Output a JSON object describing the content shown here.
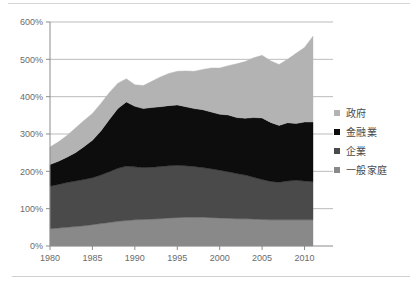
{
  "chart_data": {
    "type": "area",
    "stacked": true,
    "title": "",
    "subtitle": "",
    "xlabel": "",
    "ylabel": "",
    "xlim": [
      1980,
      2011
    ],
    "ylim": [
      0,
      600
    ],
    "ytick_labels": [
      "0%",
      "100%",
      "200%",
      "300%",
      "400%",
      "500%",
      "600%"
    ],
    "ytick_values": [
      0,
      100,
      200,
      300,
      400,
      500,
      600
    ],
    "xtick_labels": [
      "1980",
      "1985",
      "1990",
      "1995",
      "2000",
      "2005",
      "2010"
    ],
    "xtick_values": [
      1980,
      1985,
      1990,
      1995,
      2000,
      2005,
      2010
    ],
    "grid": "horizontal",
    "legend_position": "right",
    "x": [
      1980,
      1981,
      1982,
      1983,
      1984,
      1985,
      1986,
      1987,
      1988,
      1989,
      1990,
      1991,
      1992,
      1993,
      1994,
      1995,
      1996,
      1997,
      1998,
      1999,
      2000,
      2001,
      2002,
      2003,
      2004,
      2005,
      2006,
      2007,
      2008,
      2009,
      2010,
      2011
    ],
    "series": [
      {
        "name": "一般家庭",
        "color": "#898989",
        "order": 1,
        "values": [
          46,
          48,
          50,
          52,
          54,
          57,
          60,
          63,
          66,
          68,
          70,
          71,
          72,
          73,
          75,
          76,
          77,
          77,
          77,
          76,
          75,
          74,
          73,
          73,
          72,
          71,
          70,
          70,
          70,
          70,
          70,
          70
        ]
      },
      {
        "name": "企業",
        "color": "#4a4a4a",
        "order": 2,
        "values": [
          114,
          117,
          120,
          122,
          124,
          126,
          130,
          136,
          142,
          146,
          142,
          139,
          139,
          140,
          140,
          140,
          138,
          136,
          133,
          131,
          128,
          125,
          121,
          117,
          112,
          107,
          103,
          101,
          104,
          106,
          104,
          102
        ]
      },
      {
        "name": "金融業",
        "color": "#0d0d0d",
        "order": 3,
        "values": [
          58,
          62,
          68,
          76,
          88,
          100,
          118,
          140,
          160,
          172,
          162,
          158,
          160,
          160,
          161,
          162,
          158,
          155,
          155,
          152,
          150,
          152,
          150,
          152,
          160,
          165,
          158,
          152,
          156,
          152,
          158,
          160
        ]
      },
      {
        "name": "政府",
        "color": "#b3b3b3",
        "order": 4,
        "values": [
          47,
          52,
          58,
          66,
          70,
          72,
          74,
          72,
          68,
          62,
          58,
          62,
          70,
          80,
          86,
          90,
          96,
          100,
          108,
          118,
          124,
          132,
          144,
          152,
          160,
          168,
          165,
          163,
          170,
          188,
          200,
          230
        ]
      }
    ]
  },
  "legend": {
    "items": [
      {
        "label": "政府",
        "color": "#b3b3b3",
        "swatch_name": "legend-swatch-government"
      },
      {
        "label": "金融業",
        "color": "#0d0d0d",
        "swatch_name": "legend-swatch-financial"
      },
      {
        "label": "企業",
        "color": "#4a4a4a",
        "swatch_name": "legend-swatch-corporate"
      },
      {
        "label": "一般家庭",
        "color": "#898989",
        "swatch_name": "legend-swatch-household"
      }
    ]
  },
  "axes": {
    "y_labels": [
      "600%",
      "500%",
      "400%",
      "300%",
      "200%",
      "100%",
      "0%"
    ],
    "x_labels": [
      "1980",
      "1985",
      "1990",
      "1995",
      "2000",
      "2005",
      "2010"
    ]
  },
  "colors": {
    "government": "#b3b3b3",
    "financial": "#0d0d0d",
    "corporate": "#4a4a4a",
    "household": "#898989",
    "gridline": "#a9a9a9",
    "axis": "#8c8c8c",
    "tick_text": "#6b6b6b",
    "rule": "#d6d6d6"
  }
}
